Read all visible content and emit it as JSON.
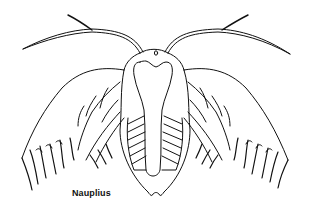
{
  "illustration": {
    "subject": "nauplius larva line drawing",
    "caption": "Nauplius",
    "line_color": "#111111",
    "background_color": "#ffffff"
  }
}
